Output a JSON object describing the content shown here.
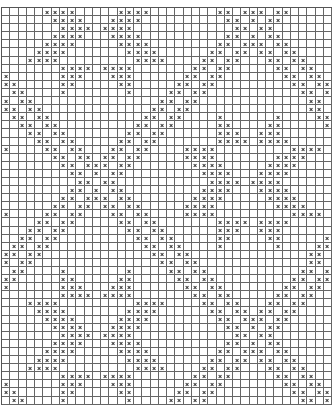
{
  "chart": {
    "type": "filet-crochet-cross-stitch-grid",
    "cols": 40,
    "rows": 49,
    "cell_w": 8.25,
    "cell_h": 8.1,
    "grid_color": "#666666",
    "mark_color": "#333333",
    "mark_symbol": "×",
    "base_rows": [
      [
        5,
        6,
        7,
        8,
        14,
        15,
        16,
        17,
        26,
        27,
        29,
        30,
        31,
        33,
        34
      ],
      [
        6,
        7,
        8,
        9,
        13,
        14,
        15,
        16,
        27,
        28,
        30,
        32,
        33
      ],
      [
        7,
        8,
        9,
        10,
        12,
        13,
        14,
        15,
        28,
        29,
        31,
        32
      ],
      [
        6,
        7,
        8,
        9,
        13,
        14,
        15,
        16,
        27,
        28,
        30,
        32,
        33
      ],
      [
        5,
        6,
        7,
        8,
        14,
        15,
        16,
        17,
        26,
        27,
        29,
        30,
        31,
        33,
        34
      ],
      [
        4,
        5,
        6,
        7,
        15,
        16,
        17,
        18,
        25,
        26,
        28,
        29,
        31,
        32,
        34,
        35
      ],
      [
        3,
        4,
        5,
        6,
        16,
        17,
        18,
        19,
        24,
        25,
        27,
        28,
        32,
        33,
        35,
        36
      ],
      [
        7,
        8,
        9,
        10,
        12,
        13,
        14,
        15,
        23,
        24,
        26,
        27,
        33,
        34,
        36,
        37
      ],
      [
        0,
        7,
        8,
        9,
        13,
        14,
        15,
        22,
        23,
        25,
        26,
        34,
        35,
        37,
        38
      ],
      [
        0,
        1,
        7,
        8,
        14,
        15,
        21,
        22,
        24,
        25,
        35,
        36,
        38,
        39
      ],
      [
        1,
        2,
        7,
        15,
        20,
        21,
        23,
        24,
        36,
        37,
        39
      ],
      [
        0,
        2,
        3,
        19,
        20,
        22,
        23,
        37,
        38
      ],
      [
        0,
        1,
        3,
        4,
        18,
        19,
        21,
        22,
        37,
        38
      ],
      [
        1,
        2,
        4,
        5,
        17,
        18,
        20,
        21,
        26,
        33,
        38,
        39
      ],
      [
        2,
        3,
        5,
        6,
        16,
        17,
        19,
        20,
        26,
        27,
        32,
        33,
        39
      ],
      [
        3,
        4,
        6,
        7,
        15,
        16,
        18,
        19,
        26,
        27,
        28,
        31,
        32,
        33
      ],
      [
        4,
        5,
        7,
        8,
        14,
        15,
        17,
        18,
        26,
        27,
        28,
        29,
        31,
        32,
        33,
        34
      ],
      [
        0,
        5,
        6,
        8,
        9,
        13,
        14,
        16,
        17,
        22,
        23,
        24,
        25,
        35,
        36,
        37,
        38
      ],
      [
        6,
        7,
        9,
        10,
        12,
        13,
        15,
        16,
        22,
        23,
        24,
        25,
        33,
        34,
        35,
        36
      ],
      [
        7,
        8,
        10,
        11,
        12,
        14,
        15,
        23,
        24,
        25,
        26,
        32,
        33,
        34,
        35
      ],
      [
        8,
        9,
        11,
        13,
        14,
        24,
        25,
        26,
        27,
        31,
        32,
        33,
        34
      ],
      [
        9,
        10,
        12,
        13,
        25,
        26,
        27,
        28,
        30,
        31,
        32,
        33
      ]
    ]
  }
}
